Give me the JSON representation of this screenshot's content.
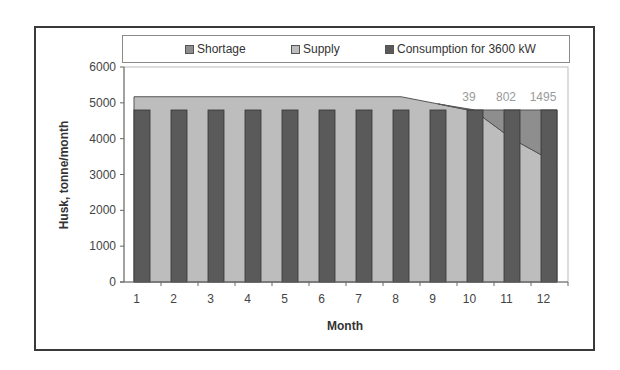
{
  "chart_data": {
    "type": "bar+area",
    "title": "",
    "xlabel": "Month",
    "ylabel": "Husk, tonne/month",
    "ylim": [
      0,
      6000
    ],
    "yticks": [
      0,
      1000,
      2000,
      3000,
      4000,
      5000,
      6000
    ],
    "categories": [
      "1",
      "2",
      "3",
      "4",
      "5",
      "6",
      "7",
      "8",
      "9",
      "10",
      "11",
      "12"
    ],
    "legend": [
      "Shortage",
      "Supply",
      "Consumption for 3600 kW"
    ],
    "legend_position": "top",
    "grid": false,
    "series": [
      {
        "name": "Supply",
        "type": "area",
        "color": "#bdbdbd",
        "values": [
          5170,
          5170,
          5170,
          5170,
          5170,
          5170,
          5170,
          5170,
          4970,
          4761,
          3998,
          3305
        ]
      },
      {
        "name": "Shortage",
        "type": "area",
        "color": "#8e8e8e",
        "values": [
          0,
          0,
          0,
          0,
          0,
          0,
          0,
          0,
          0,
          39,
          802,
          1495
        ]
      },
      {
        "name": "Consumption for 3600 kW",
        "type": "bar",
        "color": "#5a5a5a",
        "values": [
          4800,
          4800,
          4800,
          4800,
          4800,
          4800,
          4800,
          4800,
          4800,
          4800,
          4800,
          4800
        ]
      }
    ],
    "annotations": [
      {
        "month": "10",
        "text": "39"
      },
      {
        "month": "11",
        "text": "802"
      },
      {
        "month": "12",
        "text": "1495"
      }
    ]
  },
  "labels": {
    "legend_shortage": "Shortage",
    "legend_supply": "Supply",
    "legend_consumption": "Consumption for 3600 kW",
    "xlabel": "Month",
    "ylabel": "Husk, tonne/month"
  },
  "colors": {
    "shortage": "#8e8e8e",
    "supply": "#bdbdbd",
    "consumption": "#5a5a5a",
    "axis": "#666666",
    "annotation": "#9a9a9a"
  }
}
